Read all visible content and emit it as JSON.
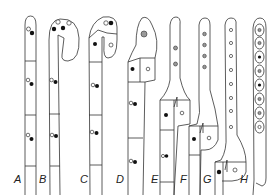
{
  "figure": {
    "panels": [
      {
        "id": "A",
        "label": "A",
        "label_x": 18
      },
      {
        "id": "B",
        "label": "B",
        "label_x": 43
      },
      {
        "id": "C",
        "label": "C",
        "label_x": 84
      },
      {
        "id": "D",
        "label": "D",
        "label_x": 120
      },
      {
        "id": "E",
        "label": "E",
        "label_x": 155
      },
      {
        "id": "F",
        "label": "F",
        "label_x": 183
      },
      {
        "id": "G",
        "label": "G",
        "label_x": 206
      },
      {
        "id": "H",
        "label": "H",
        "label_x": 244
      }
    ],
    "colors": {
      "line": "#333333",
      "dark_nucleus": "#111111",
      "background": "#ffffff"
    }
  }
}
